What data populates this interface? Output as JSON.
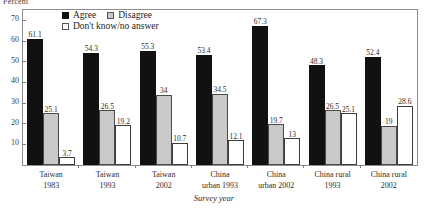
{
  "chart_data": {
    "type": "bar",
    "title": "",
    "xlabel": "Survey year",
    "ylabel": "Percent",
    "ylim": [
      0,
      75
    ],
    "yticks": [
      10,
      20,
      30,
      40,
      50,
      60,
      70
    ],
    "grid": false,
    "legend_position": "top-center",
    "categories": [
      {
        "line1": "Taiwan",
        "line2": "1983"
      },
      {
        "line1": "Taiwan",
        "line2": "1993"
      },
      {
        "line1": "Taiwan",
        "line2": "2002"
      },
      {
        "line1": "China",
        "line2": "urban 1993"
      },
      {
        "line1": "China",
        "line2": "urban 2002"
      },
      {
        "line1": "China rural",
        "line2": "1993"
      },
      {
        "line1": "China rural",
        "line2": "2002"
      }
    ],
    "series": [
      {
        "name": "Agree",
        "color": "#111111",
        "values": [
          61.1,
          54.3,
          55.3,
          53.4,
          67.3,
          48.3,
          52.4
        ],
        "labels": [
          "61.1",
          "54.3",
          "55.3",
          "53.4",
          "67.3",
          "48.3",
          "52.4"
        ]
      },
      {
        "name": "Disagree",
        "color": "#c9c9c9",
        "values": [
          25.1,
          26.5,
          34,
          34.5,
          19.7,
          26.5,
          19
        ],
        "labels": [
          "25.1",
          "26.5",
          "34",
          "34.5",
          "19.7",
          "26.5",
          "19"
        ]
      },
      {
        "name": "Don't know/no answer",
        "color": "#ffffff",
        "values": [
          3.7,
          19.2,
          10.7,
          12.1,
          13,
          25.1,
          28.6
        ],
        "labels": [
          "3.7",
          "19.2",
          "10.7",
          "12.1",
          "13",
          "25.1",
          "28.6"
        ]
      }
    ]
  }
}
